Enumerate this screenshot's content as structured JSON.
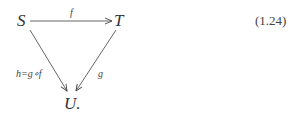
{
  "diagram": {
    "nodes": {
      "S": "S",
      "T": "T",
      "U": "U."
    },
    "arrows": {
      "f": {
        "from": "S",
        "to": "T",
        "label": "f"
      },
      "g": {
        "from": "T",
        "to": "U",
        "label": "g"
      },
      "h": {
        "from": "S",
        "to": "U",
        "label": "h=g∘f"
      }
    }
  },
  "equation_number": "(1.24)",
  "colors": {
    "ink": "#333333",
    "background": "#ffffff"
  }
}
